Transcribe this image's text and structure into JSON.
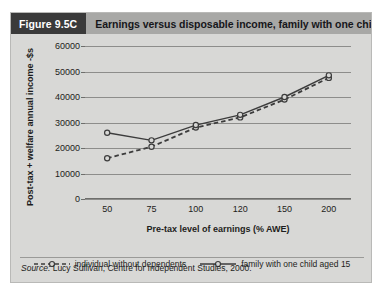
{
  "figure": {
    "number_label": "Figure 9.5C",
    "title": "Earnings versus disposable income, family with one child, 1997",
    "source_prefix": "Source:",
    "source_text": " Lucy Sullivan, Centre for Independent Studies, 2000."
  },
  "colors": {
    "panel_background": "#d8d8d6",
    "figure_number_background": "#3a3a3a",
    "title_banner_background": "#a8a8a6",
    "gridline": "#8d8d8b",
    "series_line": "#3c3c3c",
    "marker_fill": "#d8d8d6",
    "text": "#1d1d20"
  },
  "chart_data": {
    "type": "line",
    "title": "Earnings versus disposable income, family with one child, 1997",
    "xlabel": "Pre-tax level of earnings (% AWE)",
    "ylabel": "Post-tax + welfare annual income -$s",
    "categories": [
      "50",
      "75",
      "100",
      "120",
      "150",
      "200"
    ],
    "ylim": [
      0,
      60000
    ],
    "yticks": [
      "0",
      "10000",
      "20000",
      "30000",
      "40000",
      "50000",
      "60000"
    ],
    "ytick_values": [
      0,
      10000,
      20000,
      30000,
      40000,
      50000,
      60000
    ],
    "grid": "horizontal",
    "legend_position": "below-axis",
    "series": [
      {
        "name": "individual without dependents",
        "style": "dashed",
        "marker": "open-circle",
        "values": [
          16000,
          20500,
          28000,
          32000,
          39000,
          47500
        ]
      },
      {
        "name": "family with one child aged 15",
        "style": "solid",
        "marker": "open-circle",
        "values": [
          26000,
          23000,
          29000,
          33000,
          40000,
          48500
        ]
      }
    ]
  }
}
